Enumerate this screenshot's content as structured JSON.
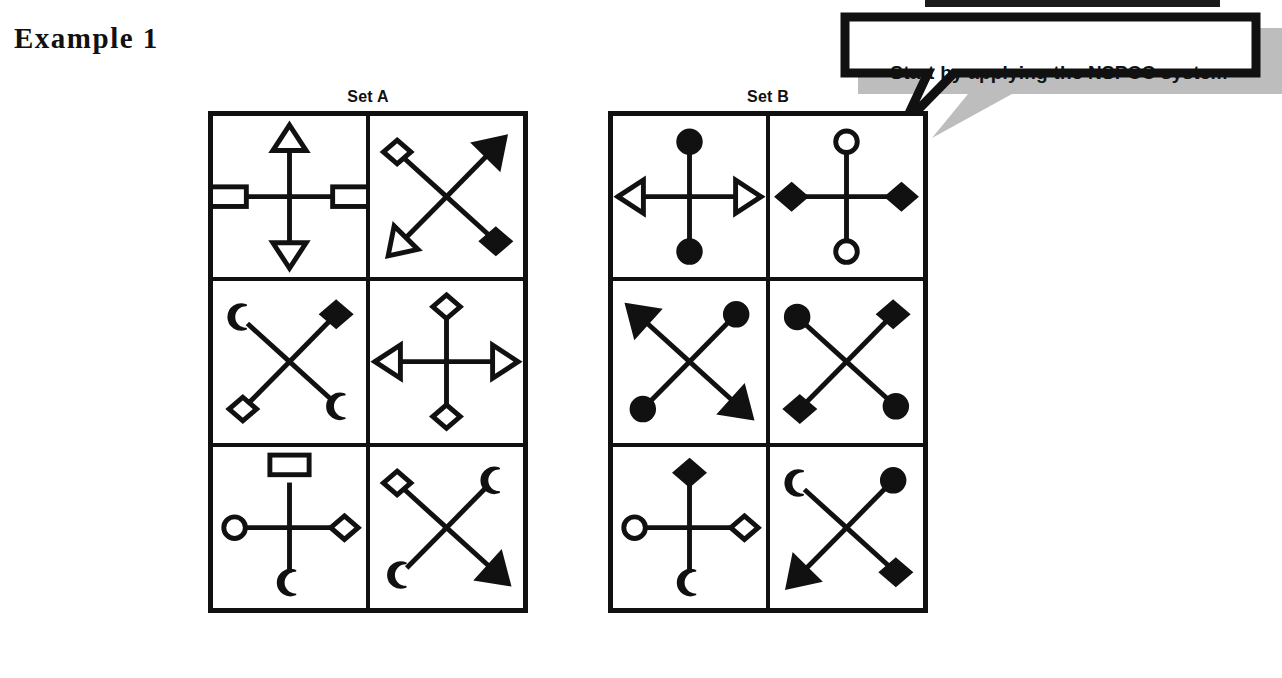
{
  "page_title": "Example 1",
  "callout": {
    "text": "Start by applying the NSPCC system",
    "border_color": "#111111",
    "shadow_color": "#bdbdbd",
    "fill_color": "#ffffff"
  },
  "top_bar": {
    "color": "#1a1a1a"
  },
  "sets": [
    {
      "id": "setA",
      "label": "Set A",
      "cells": [
        {
          "name": "set-a-cell-1",
          "layout": "plus",
          "arms": [
            {
              "position": "top",
              "shape": "triangle",
              "fill": "outline"
            },
            {
              "position": "bottom",
              "shape": "triangle",
              "fill": "outline"
            },
            {
              "position": "left",
              "shape": "rectangle",
              "fill": "outline"
            },
            {
              "position": "right",
              "shape": "rectangle",
              "fill": "outline"
            }
          ]
        },
        {
          "name": "set-a-cell-2",
          "layout": "cross",
          "arms": [
            {
              "position": "top-left",
              "shape": "diamond",
              "fill": "outline"
            },
            {
              "position": "bottom-right",
              "shape": "diamond",
              "fill": "filled"
            },
            {
              "position": "bottom-left",
              "shape": "triangle",
              "fill": "outline"
            },
            {
              "position": "top-right",
              "shape": "triangle",
              "fill": "filled"
            }
          ]
        },
        {
          "name": "set-a-cell-3",
          "layout": "cross",
          "arms": [
            {
              "position": "top-left",
              "shape": "crescent",
              "fill": "filled"
            },
            {
              "position": "bottom-right",
              "shape": "crescent",
              "fill": "filled"
            },
            {
              "position": "bottom-left",
              "shape": "diamond",
              "fill": "outline"
            },
            {
              "position": "top-right",
              "shape": "diamond",
              "fill": "filled"
            }
          ]
        },
        {
          "name": "set-a-cell-4",
          "layout": "plus",
          "arms": [
            {
              "position": "top",
              "shape": "diamond",
              "fill": "outline"
            },
            {
              "position": "bottom",
              "shape": "diamond",
              "fill": "outline"
            },
            {
              "position": "left",
              "shape": "triangle",
              "fill": "outline"
            },
            {
              "position": "right",
              "shape": "triangle",
              "fill": "outline"
            }
          ]
        },
        {
          "name": "set-a-cell-5",
          "layout": "plus",
          "arms": [
            {
              "position": "top",
              "shape": "rectangle",
              "fill": "outline"
            },
            {
              "position": "bottom",
              "shape": "crescent",
              "fill": "filled"
            },
            {
              "position": "left",
              "shape": "circle",
              "fill": "outline"
            },
            {
              "position": "right",
              "shape": "diamond",
              "fill": "outline"
            }
          ]
        },
        {
          "name": "set-a-cell-6",
          "layout": "cross",
          "arms": [
            {
              "position": "top-left",
              "shape": "diamond",
              "fill": "outline"
            },
            {
              "position": "bottom-right",
              "shape": "triangle",
              "fill": "filled"
            },
            {
              "position": "bottom-left",
              "shape": "crescent",
              "fill": "filled"
            },
            {
              "position": "top-right",
              "shape": "crescent",
              "fill": "filled"
            }
          ]
        }
      ]
    },
    {
      "id": "setB",
      "label": "Set B",
      "cells": [
        {
          "name": "set-b-cell-1",
          "layout": "plus",
          "arms": [
            {
              "position": "top",
              "shape": "circle",
              "fill": "filled"
            },
            {
              "position": "bottom",
              "shape": "circle",
              "fill": "filled"
            },
            {
              "position": "left",
              "shape": "triangle",
              "fill": "outline"
            },
            {
              "position": "right",
              "shape": "triangle",
              "fill": "outline"
            }
          ]
        },
        {
          "name": "set-b-cell-2",
          "layout": "plus",
          "arms": [
            {
              "position": "top",
              "shape": "circle",
              "fill": "outline"
            },
            {
              "position": "bottom",
              "shape": "circle",
              "fill": "outline"
            },
            {
              "position": "left",
              "shape": "diamond",
              "fill": "filled"
            },
            {
              "position": "right",
              "shape": "diamond",
              "fill": "filled"
            }
          ]
        },
        {
          "name": "set-b-cell-3",
          "layout": "cross",
          "arms": [
            {
              "position": "top-left",
              "shape": "triangle",
              "fill": "filled"
            },
            {
              "position": "bottom-right",
              "shape": "triangle",
              "fill": "filled"
            },
            {
              "position": "bottom-left",
              "shape": "circle",
              "fill": "filled"
            },
            {
              "position": "top-right",
              "shape": "circle",
              "fill": "filled"
            }
          ]
        },
        {
          "name": "set-b-cell-4",
          "layout": "cross",
          "arms": [
            {
              "position": "top-left",
              "shape": "circle",
              "fill": "filled"
            },
            {
              "position": "bottom-right",
              "shape": "circle",
              "fill": "filled"
            },
            {
              "position": "bottom-left",
              "shape": "diamond",
              "fill": "filled"
            },
            {
              "position": "top-right",
              "shape": "diamond",
              "fill": "filled"
            }
          ]
        },
        {
          "name": "set-b-cell-5",
          "layout": "plus",
          "arms": [
            {
              "position": "top",
              "shape": "diamond",
              "fill": "filled"
            },
            {
              "position": "bottom",
              "shape": "crescent",
              "fill": "filled"
            },
            {
              "position": "left",
              "shape": "circle",
              "fill": "outline"
            },
            {
              "position": "right",
              "shape": "diamond",
              "fill": "outline"
            }
          ]
        },
        {
          "name": "set-b-cell-6",
          "layout": "cross",
          "arms": [
            {
              "position": "top-left",
              "shape": "crescent",
              "fill": "filled"
            },
            {
              "position": "bottom-right",
              "shape": "diamond",
              "fill": "filled"
            },
            {
              "position": "bottom-left",
              "shape": "triangle",
              "fill": "filled"
            },
            {
              "position": "top-right",
              "shape": "circle",
              "fill": "filled"
            }
          ]
        }
      ]
    }
  ]
}
